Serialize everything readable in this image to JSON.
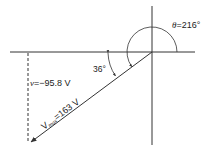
{
  "diagram": {
    "type": "phasor",
    "theta_label": {
      "symbol": "θ",
      "eq": "=",
      "value": "216°"
    },
    "angle_label": "36°",
    "instant_label": {
      "symbol": "v",
      "eq": "=",
      "value": "−95.8 V"
    },
    "vmax_label": {
      "symbol": "V",
      "sub": "max",
      "eq": "=",
      "value": "163 V"
    },
    "colors": {
      "line": "#333333",
      "background": "#ffffff"
    }
  }
}
